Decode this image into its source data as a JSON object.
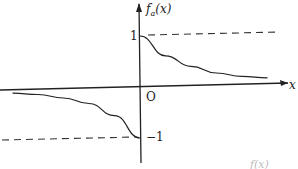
{
  "chart_data": {
    "type": "line",
    "title": "",
    "xlabel": "x",
    "ylabel": "f_a(x)",
    "ylabel_base": "f",
    "ylabel_sub": "a",
    "ylabel_arg": "(x)",
    "origin_label": "O",
    "ytick_labels": [
      "1",
      "−1"
    ],
    "yticks": [
      1,
      -1
    ],
    "asymptotes": [
      {
        "name": "upper",
        "y": 1,
        "side": "x>0",
        "style": "dashed"
      },
      {
        "name": "lower",
        "y": -1,
        "side": "x<0",
        "style": "dashed"
      }
    ],
    "series": [
      {
        "name": "right-branch",
        "description": "decays from 1 at x=0+ toward 0",
        "x": [
          0,
          1,
          2,
          3,
          4,
          5
        ],
        "y": [
          1,
          0.6,
          0.38,
          0.24,
          0.16,
          0.12
        ]
      },
      {
        "name": "left-branch",
        "description": "decays from -1 at x=0- toward 0",
        "x": [
          -5,
          -4,
          -3,
          -2,
          -1,
          0
        ],
        "y": [
          -0.06,
          -0.1,
          -0.18,
          -0.3,
          -0.55,
          -1
        ]
      }
    ],
    "xlim": [
      -5.5,
      5.8
    ],
    "ylim": [
      -1.3,
      1.6
    ],
    "grid": false,
    "legend": "none",
    "caption_partial": "f(x)"
  }
}
